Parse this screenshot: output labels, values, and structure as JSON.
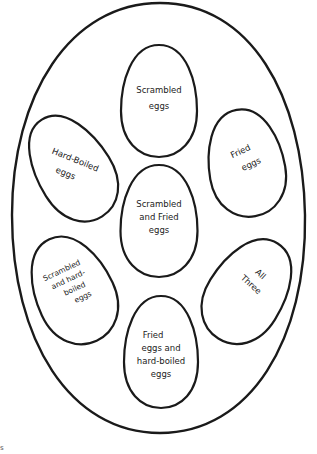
{
  "diagram": {
    "type": "egg-venn-diagram",
    "outer_egg": {
      "cx": 158.5,
      "cy": 218,
      "rx": 146.5,
      "ry_top": 215,
      "ry_bottom": 215,
      "stroke": "#1a1a1a"
    },
    "eggs": [
      {
        "id": "scrambled",
        "lines": [
          "Scrambled",
          "eggs"
        ],
        "cx": 159,
        "cy": 101,
        "w": 76,
        "h": 113,
        "rotate": 0
      },
      {
        "id": "hard-boiled",
        "lines": [
          "Hard-Boiled",
          "eggs"
        ],
        "cx": 72,
        "cy": 168,
        "w": 74,
        "h": 114,
        "rotate": -32
      },
      {
        "id": "fried",
        "lines": [
          "Fried",
          "eggs"
        ],
        "cx": 246,
        "cy": 163,
        "w": 76,
        "h": 108,
        "rotate": -10
      },
      {
        "id": "scrambled-and-fried",
        "lines": [
          "Scrambled",
          "and Fried",
          "eggs"
        ],
        "cx": 159,
        "cy": 221,
        "w": 77,
        "h": 113,
        "rotate": 0
      },
      {
        "id": "scrambled-and-hard-boiled",
        "lines": [
          "Scrambled",
          "and hard-",
          "boiled",
          "eggs"
        ],
        "cx": 73,
        "cy": 290,
        "w": 78,
        "h": 112,
        "rotate": -25
      },
      {
        "id": "all-three",
        "lines": [
          "All",
          "Three"
        ],
        "cx": 248,
        "cy": 291,
        "w": 76,
        "h": 112,
        "rotate": 32
      },
      {
        "id": "fried-and-hard-boiled",
        "lines": [
          "Fried",
          "eggs and",
          "hard-boiled",
          "eggs"
        ],
        "cx": 161,
        "cy": 352,
        "w": 74,
        "h": 112,
        "rotate": 0
      }
    ],
    "colors": {
      "background": "#ffffff",
      "line": "#1a1a1a",
      "text": "#222222"
    }
  },
  "labels": {
    "scrambled": [
      "Scrambled",
      "eggs"
    ],
    "hard_boiled": [
      "Hard-Boiled",
      "eggs"
    ],
    "fried": [
      "Fried",
      "eggs"
    ],
    "scrambled_and_fried": [
      "Scrambled",
      "and Fried",
      "eggs"
    ],
    "scrambled_and_hard_boiled": [
      "Scrambled",
      "and hard-",
      "boiled",
      "eggs"
    ],
    "all_three": [
      "All",
      "Three"
    ],
    "fried_and_hard_boiled": [
      "Fried",
      "eggs and",
      "hard-boiled",
      "eggs"
    ]
  },
  "corner_mark": "s"
}
